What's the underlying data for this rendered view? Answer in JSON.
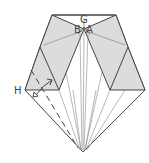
{
  "diagram": {
    "type": "origami-fold-diagram",
    "labels": {
      "G": "G",
      "B": "B",
      "A": "A",
      "H": "H"
    },
    "colors": {
      "paper_shaded": "#d9d9d9",
      "line": "#444444",
      "thin_line": "#888888",
      "background": "#ffffff"
    },
    "symbols": [
      "valley-fold-dashed-line",
      "fold-over-double-arrow"
    ]
  }
}
